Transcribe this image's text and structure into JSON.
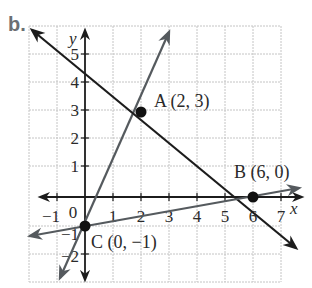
{
  "figure": {
    "part_label": "b.",
    "axes": {
      "x_label": "x",
      "y_label": "y",
      "origin_label": "0",
      "x_ticks": [
        {
          "value": -1,
          "label": "−1"
        },
        {
          "value": 1,
          "label": "1"
        },
        {
          "value": 2,
          "label": "2"
        },
        {
          "value": 3,
          "label": "3"
        },
        {
          "value": 4,
          "label": "4"
        },
        {
          "value": 5,
          "label": "5"
        },
        {
          "value": 6,
          "label": "6"
        },
        {
          "value": 7,
          "label": "7"
        }
      ],
      "y_ticks": [
        {
          "value": 5,
          "label": "5"
        },
        {
          "value": 4,
          "label": "4"
        },
        {
          "value": 3,
          "label": "3"
        },
        {
          "value": 2,
          "label": "2"
        },
        {
          "value": 1,
          "label": "1"
        },
        {
          "value": -1,
          "label": "−1"
        },
        {
          "value": -2,
          "label": "−2"
        }
      ],
      "x_range": [
        -2,
        8
      ],
      "y_range": [
        -3,
        6
      ]
    },
    "points": [
      {
        "name": "A",
        "x": 2,
        "y": 3,
        "label": "A (2, 3)"
      },
      {
        "name": "B",
        "x": 6,
        "y": 0,
        "label": "B (6, 0)"
      },
      {
        "name": "C",
        "x": 0,
        "y": -1,
        "label": "C (0, −1)"
      }
    ],
    "lines": [
      {
        "name": "line-AC",
        "through": [
          "C",
          "A"
        ],
        "color": "#555a5e",
        "equation": "y = 2x - 1"
      },
      {
        "name": "line-AB",
        "through": [
          "A",
          "B"
        ],
        "color": "#1c1c1c",
        "equation": "y = -3/4 x + 9/2"
      },
      {
        "name": "line-BC",
        "through": [
          "C",
          "B"
        ],
        "color": "#555a5e",
        "equation": "y = 1/6 x - 1"
      }
    ],
    "colors": {
      "grid": "#c4c4c4",
      "axis": "#1c1c1c",
      "line_gray": "#555a5e",
      "line_dark": "#1c1c1c",
      "point": "#111111",
      "part_label": "#6b6f73"
    }
  }
}
